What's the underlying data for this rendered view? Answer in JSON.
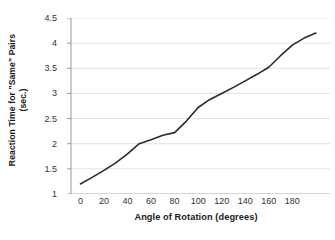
{
  "chart_data": {
    "type": "line",
    "title": "",
    "xlabel": "Angle of Rotation (degrees)",
    "ylabel_line1": "Reaction Time for \"Same\" Pairs",
    "ylabel_line2": "(sec.)",
    "xlim": [
      -8,
      212
    ],
    "ylim": [
      1,
      4.5
    ],
    "xticks": [
      0,
      20,
      40,
      60,
      80,
      100,
      120,
      140,
      160,
      180
    ],
    "xtick_labels": [
      "0",
      "20",
      "40",
      "60",
      "80",
      "100",
      "120",
      "140",
      "160",
      "180"
    ],
    "yticks": [
      1,
      1.5,
      2,
      2.5,
      3,
      3.5,
      4,
      4.5
    ],
    "ytick_labels": [
      "1",
      "1.5",
      "2",
      "2.5",
      "3",
      "3.5",
      "4",
      "4.5"
    ],
    "grid": "horizontal",
    "legend": "none",
    "series": [
      {
        "name": "\"Same\" pairs reaction time",
        "color": "#2a2a2a",
        "linewidth": 1.6,
        "x": [
          0,
          10,
          20,
          30,
          40,
          50,
          60,
          70,
          80,
          90,
          100,
          110,
          120,
          130,
          140,
          150,
          160,
          170,
          180,
          190,
          200
        ],
        "y": [
          1.2,
          1.33,
          1.47,
          1.62,
          1.8,
          2.0,
          2.08,
          2.17,
          2.22,
          2.45,
          2.72,
          2.88,
          3.0,
          3.12,
          3.25,
          3.38,
          3.52,
          3.75,
          3.96,
          4.1,
          4.2
        ]
      }
    ]
  }
}
